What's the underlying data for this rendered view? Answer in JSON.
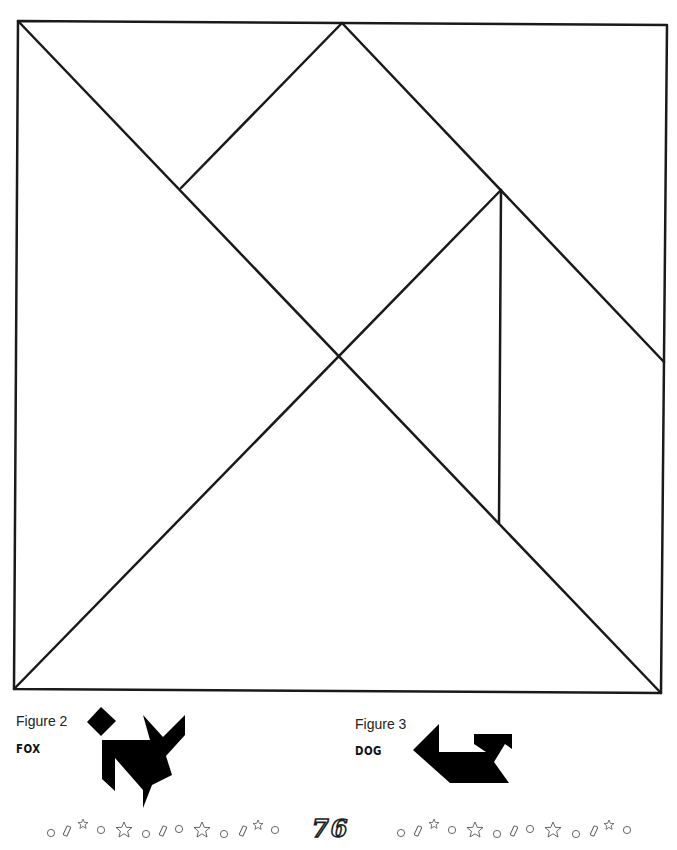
{
  "puzzle": {
    "outline_color": "#1a1a1a",
    "square": {
      "tl": [
        18,
        21
      ],
      "tr": [
        667,
        25
      ],
      "br": [
        661,
        693
      ],
      "bl": [
        14,
        689
      ]
    },
    "lines": [
      {
        "from": [
          18,
          21
        ],
        "to": [
          661,
          693
        ]
      },
      {
        "from": [
          342,
          23
        ],
        "to": [
          664,
          362
        ]
      },
      {
        "from": [
          342,
          23
        ],
        "to": [
          181,
          188
        ]
      },
      {
        "from": [
          14,
          689
        ],
        "to": [
          501,
          190
        ]
      },
      {
        "from": [
          501,
          190
        ],
        "to": [
          499,
          523
        ]
      }
    ]
  },
  "figures": [
    {
      "label": "Figure 2",
      "name": "FOX",
      "fill": "#000000"
    },
    {
      "label": "Figure 3",
      "name": "DOG",
      "fill": "#000000"
    }
  ],
  "footer": {
    "page_number": "76",
    "decoration_left": [
      "circle",
      "rect",
      "small-star",
      "circle",
      "star",
      "circle",
      "rect",
      "circle",
      "star",
      "circle",
      "rect",
      "small-star",
      "circle"
    ],
    "decoration_right": [
      "circle",
      "rect",
      "small-star",
      "circle",
      "star",
      "circle",
      "rect",
      "circle",
      "star",
      "circle",
      "rect",
      "small-star",
      "circle"
    ]
  }
}
